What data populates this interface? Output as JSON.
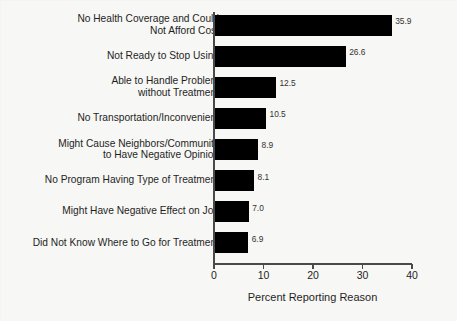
{
  "chart_data": {
    "type": "bar",
    "orientation": "horizontal",
    "title": "",
    "xlabel": "Percent Reporting Reason",
    "ylabel": "",
    "xlim": [
      0,
      40
    ],
    "xticks": [
      0,
      10,
      20,
      30,
      40
    ],
    "xtick_labels": [
      "0",
      "10",
      "20",
      "30",
      "40"
    ],
    "grid": false,
    "legend": null,
    "bar_color": "#000000",
    "categories": [
      "No Health Coverage and Could\nNot Afford Cost",
      "Not Ready to Stop Using",
      "Able to Handle Problem\nwithout Treatment",
      "No Transportation/Inconvenient",
      "Might Cause Neighbors/Community\nto Have Negative Opinion",
      "No Program Having Type of Treatment",
      "Might Have Negative Effect on Job",
      "Did Not Know Where to Go for Treatment"
    ],
    "values": [
      35.9,
      26.6,
      12.5,
      10.5,
      8.9,
      8.1,
      7.0,
      6.9
    ],
    "value_labels": [
      "35.9",
      "26.6",
      "12.5",
      "10.5",
      "8.9",
      "8.1",
      "7.0",
      "6.9"
    ]
  }
}
